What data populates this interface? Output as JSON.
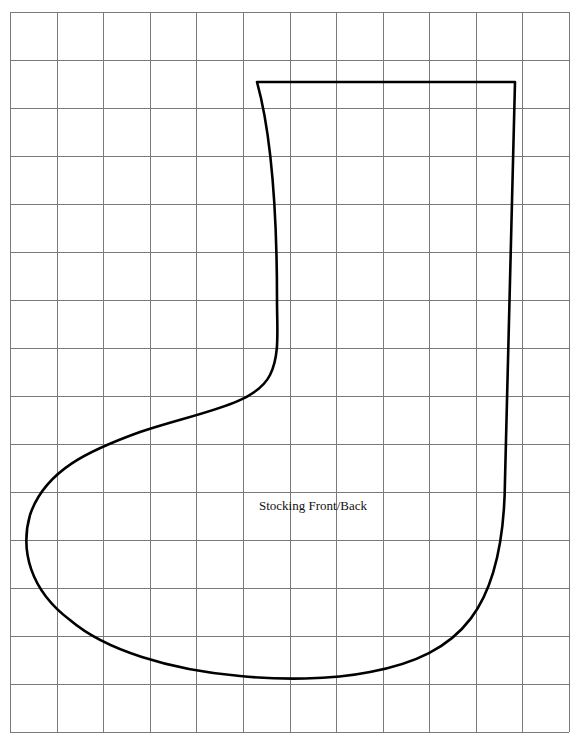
{
  "pattern": {
    "piece_label": "Stocking Front/Back",
    "label_position": {
      "x": 259,
      "y": 498
    },
    "outline_color": "#000000",
    "outline_width": 2.6
  },
  "grid": {
    "left": 10,
    "top": 12,
    "right": 569,
    "bottom": 732,
    "columns": 12,
    "rows": 15,
    "line_color": "#7a7a7a",
    "line_width": 1
  },
  "outline_path": "M257 82 L515 82 L505 480 C504 610 460 655 370 672 C330 680 280 680 240 676 C170 670 105 650 70 620 C30 590 20 550 30 515 C45 470 90 450 140 432 C200 412 255 405 270 375 C280 355 277 330 277 300 C277 220 273 140 257 82 Z"
}
